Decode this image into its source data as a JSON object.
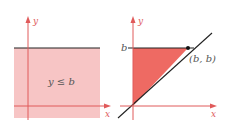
{
  "left_panel": {
    "axis_x_label": "x",
    "axis_y_label": "y",
    "region_label": "y ≤ b",
    "colors": {
      "region_fill": "#f7c5c5",
      "axis": "#e05a5a",
      "boundary": "#222222"
    }
  },
  "right_panel": {
    "axis_x_label": "x",
    "axis_y_label": "y",
    "b_tick_label": "b",
    "point_label": "(b, b)",
    "colors": {
      "region_fill": "#ee6a63",
      "axis": "#e05a5a",
      "line": "#222222",
      "point": "#111111"
    }
  }
}
